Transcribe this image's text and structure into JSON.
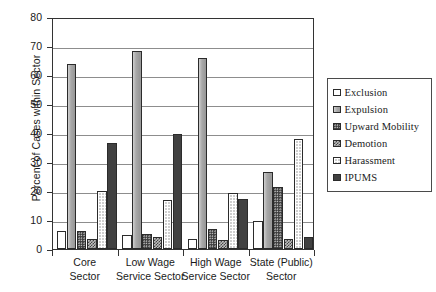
{
  "chart_data": {
    "type": "bar",
    "title": "",
    "xlabel": "",
    "ylabel": "Percent of Cases within Sector",
    "ylim": [
      0,
      80
    ],
    "ytick_step": 10,
    "yticks": [
      80,
      70,
      60,
      50,
      40,
      30,
      20,
      10,
      0
    ],
    "grid": true,
    "legend_position": "right",
    "categories": [
      "Core\nSector",
      "Low Wage\nService Sector",
      "High Wage\nService Sector",
      "State (Public)\nSector"
    ],
    "category_lines": [
      [
        "Core",
        "Sector"
      ],
      [
        "Low Wage",
        "Service Sector"
      ],
      [
        "High Wage",
        "Service Sector"
      ],
      [
        "State (Public)",
        "Sector"
      ]
    ],
    "series": [
      {
        "name": "Exclusion",
        "values": [
          6.2,
          4.9,
          3.5,
          9.7
        ],
        "pattern": "empty-white",
        "color": "#ffffff"
      },
      {
        "name": "Expulsion",
        "values": [
          63.7,
          68.3,
          65.7,
          26.7
        ],
        "pattern": "solid-light-gray",
        "color": "#a8a8a8"
      },
      {
        "name": "Upward Mobility",
        "values": [
          6.2,
          5.1,
          7.0,
          21.3
        ],
        "pattern": "dark-dotted",
        "color": "#3a3a3a"
      },
      {
        "name": "Demotion",
        "values": [
          3.5,
          4.1,
          3.1,
          3.6
        ],
        "pattern": "cross-hatch",
        "color": "#bdbdbd"
      },
      {
        "name": "Harassment",
        "values": [
          19.9,
          16.9,
          19.2,
          37.8
        ],
        "pattern": "fine-grid",
        "color": "#cfcfcf"
      },
      {
        "name": "IPUMS",
        "values": [
          36.6,
          39.6,
          17.1,
          4.1
        ],
        "pattern": "solid-dark",
        "color": "#414141"
      }
    ]
  },
  "axes": {
    "y_title": "Percent of Cases within Sector"
  },
  "legend": {
    "items": [
      {
        "label": "Exclusion"
      },
      {
        "label": "Expulsion"
      },
      {
        "label": "Upward Mobility"
      },
      {
        "label": "Demotion"
      },
      {
        "label": "Harassment"
      },
      {
        "label": "IPUMS"
      }
    ]
  }
}
